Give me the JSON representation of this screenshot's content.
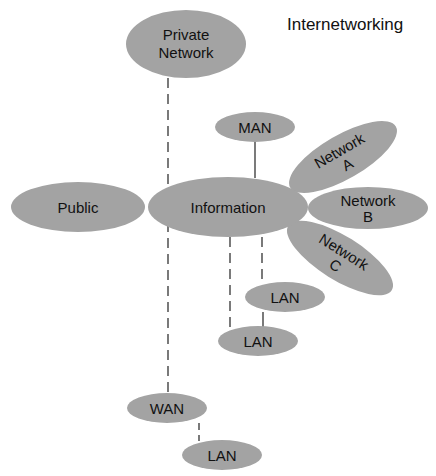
{
  "title": "Internetworking",
  "colors": {
    "node_fill": "#a3a3a3",
    "text": "#111111",
    "line": "#333333",
    "background": "#ffffff"
  },
  "nodes": {
    "private_network": {
      "line1": "Private",
      "line2": "Network"
    },
    "man": {
      "label": "MAN"
    },
    "network_a": {
      "line1": "Network",
      "line2": "A"
    },
    "public": {
      "label": "Public"
    },
    "information": {
      "label": "Information"
    },
    "network_b": {
      "line1": "Network",
      "line2": "B"
    },
    "network_c": {
      "line1": "Network",
      "line2": "C"
    },
    "lan_upper": {
      "label": "LAN"
    },
    "lan_lower": {
      "label": "LAN"
    },
    "wan": {
      "label": "WAN"
    },
    "lan_wan": {
      "label": "LAN"
    }
  },
  "links": [
    {
      "from": "Private Network",
      "to": "WAN",
      "style": "dashed"
    },
    {
      "from": "MAN",
      "to": "Information",
      "style": "solid"
    },
    {
      "from": "Information",
      "to": "LAN (upper)",
      "style": "dashed"
    },
    {
      "from": "Information",
      "to": "LAN (lower)",
      "style": "dashed"
    },
    {
      "from": "LAN (upper)",
      "to": "LAN (lower)",
      "style": "solid"
    },
    {
      "from": "WAN",
      "to": "LAN",
      "style": "dashed"
    }
  ]
}
